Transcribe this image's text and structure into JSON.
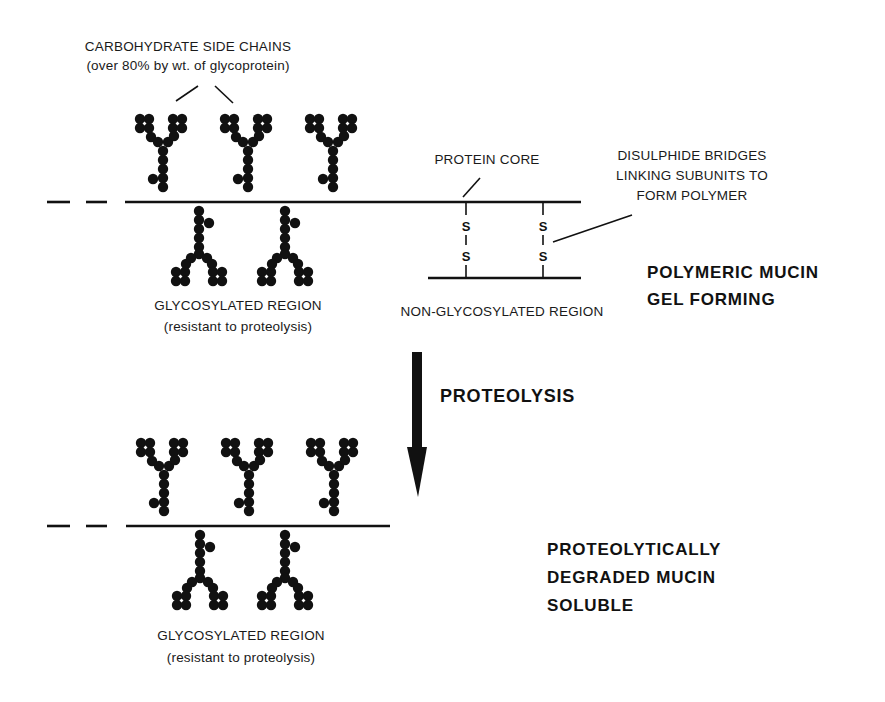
{
  "colors": {
    "ink": "#111111",
    "background": "#ffffff"
  },
  "top": {
    "carbohydrate_label": {
      "line1": "CARBOHYDRATE SIDE CHAINS",
      "line2": "(over 80% by wt. of glycoprotein)"
    },
    "protein_core_label": "PROTEIN CORE",
    "disulphide_label": {
      "line1": "DISULPHIDE BRIDGES",
      "line2": "LINKING SUBUNITS TO",
      "line3": "FORM POLYMER"
    },
    "bridge_atoms": [
      "S",
      "S"
    ],
    "glycosylated_label": {
      "line1": "GLYCOSYLATED REGION",
      "line2": "(resistant to proteolysis)"
    },
    "non_glycosylated_label": "NON-GLYCOSYLATED REGION",
    "state_label": {
      "line1": "POLYMERIC MUCIN",
      "line2": "GEL FORMING"
    }
  },
  "process": {
    "arrow_label": "PROTEOLYSIS",
    "arrow_icon": "down-arrow-icon"
  },
  "bottom": {
    "glycosylated_label": {
      "line1": "GLYCOSYLATED REGION",
      "line2": "(resistant to proteolysis)"
    },
    "state_label": {
      "line1": "PROTEOLYTICALLY",
      "line2": "DEGRADED MUCIN",
      "line3": "SOLUBLE"
    }
  }
}
